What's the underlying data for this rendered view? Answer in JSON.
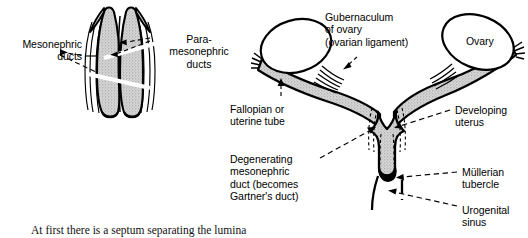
{
  "figure": {
    "caption": "At first there is a septum separating the lumina",
    "colors": {
      "ink": "#000000",
      "tissue_fill": "#cfcfcf",
      "tissue_fill_light": "#dcdcdc",
      "background": "#ffffff",
      "tubercle": "#000000"
    },
    "left_panel": {
      "name": "paired-ducts-early-stage",
      "labels": [
        {
          "id": "mesonephric-ducts",
          "text": "Mesonephric\nducts",
          "align": "right",
          "x": 2,
          "y": 38
        },
        {
          "id": "para-mesonephric-ducts",
          "text": "Para-\nmesonephric\nducts",
          "align": "center",
          "x": 157,
          "y": 33
        }
      ]
    },
    "right_panel": {
      "name": "fused-uterovaginal-canal-stage",
      "labels": [
        {
          "id": "gubernaculum-of-ovary",
          "text": "Gubernaculum\nof ovary\n(ovarian ligament)",
          "align": "left",
          "x": 325,
          "y": 11
        },
        {
          "id": "ovary",
          "text": "Ovary",
          "align": "left",
          "x": 466,
          "y": 35
        },
        {
          "id": "fallopian-or-uterine-tube",
          "text": "Fallopian or\nuterine tube",
          "align": "left",
          "x": 230,
          "y": 103
        },
        {
          "id": "degenerating-mesonephric-duct",
          "text": "Degenerating\nmesonephric\nduct (becomes\nGartner's duct)",
          "align": "left",
          "x": 230,
          "y": 153
        },
        {
          "id": "developing-uterus",
          "text": "Developing\nuterus",
          "align": "left",
          "x": 455,
          "y": 104
        },
        {
          "id": "mullerian-tubercle",
          "text": "Müllerian\ntubercle",
          "align": "left",
          "x": 462,
          "y": 166
        },
        {
          "id": "urogenital-sinus",
          "text": "Urogenital\nsinus",
          "align": "left",
          "x": 462,
          "y": 204
        }
      ]
    }
  }
}
